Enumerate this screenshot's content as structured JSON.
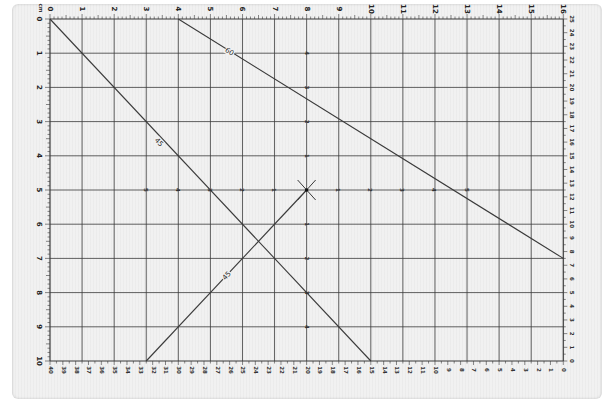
{
  "mat": {
    "background": "#f1f1f1",
    "line_color": "#3a3a3a",
    "grid": {
      "x_origin_px": 50,
      "x_step_px": 32.08,
      "x_units": 16,
      "y_origin_px": 19,
      "y_step_px": 34.2,
      "y_units": 10
    },
    "top_ruler": [
      "0",
      "1",
      "2",
      "3",
      "4",
      "5",
      "6",
      "7",
      "8",
      "9",
      "10",
      "11",
      "12",
      "13",
      "14",
      "15",
      "16"
    ],
    "left_ruler": [
      "0",
      "1",
      "2",
      "3",
      "4",
      "5",
      "6",
      "7",
      "8",
      "9",
      "10"
    ],
    "right_ruler": [
      "25",
      "24",
      "23",
      "22",
      "21",
      "20",
      "19",
      "18",
      "17",
      "16",
      "15",
      "14",
      "13",
      "12",
      "11",
      "10",
      "9",
      "8",
      "7",
      "6",
      "5",
      "4",
      "3",
      "2",
      "1",
      "0"
    ],
    "bottom_ruler": [
      "40",
      "39",
      "38",
      "37",
      "36",
      "35",
      "34",
      "33",
      "32",
      "31",
      "30",
      "29",
      "28",
      "27",
      "26",
      "25",
      "24",
      "23",
      "22",
      "21",
      "20",
      "19",
      "18",
      "17",
      "16",
      "15",
      "14",
      "13",
      "12",
      "11",
      "10",
      "9",
      "8",
      "7",
      "6",
      "5",
      "4",
      "3",
      "2",
      "1",
      "0"
    ],
    "corner_mark": "cm",
    "center_cross": {
      "x": 8,
      "y": 5
    },
    "axis_labels": {
      "horizontal_through_center": [
        "5",
        "4",
        "3",
        "2",
        "1",
        "",
        "1",
        "2",
        "3",
        "4",
        "5"
      ],
      "vertical_through_center": [
        "4",
        "3",
        "2",
        "1",
        "",
        "1",
        "2",
        "3",
        "4"
      ]
    },
    "angle_lines": [
      {
        "label": "45",
        "from": [
          0,
          0
        ],
        "to": [
          10,
          10
        ],
        "label_at": [
          3.4,
          3.6
        ]
      },
      {
        "label": "60",
        "from": [
          4,
          0
        ],
        "to": [
          16,
          7
        ],
        "label_at": [
          5.6,
          0.95
        ]
      },
      {
        "label": "45",
        "from": [
          3,
          10
        ],
        "to": [
          8,
          5
        ],
        "label_at": [
          5.5,
          7.5
        ]
      }
    ]
  }
}
